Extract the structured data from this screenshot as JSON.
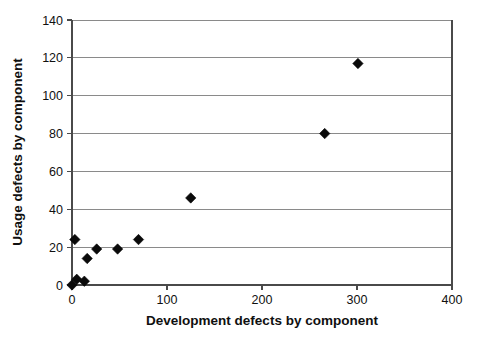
{
  "chart_data": {
    "type": "scatter",
    "title": "",
    "xlabel": "Development defects by component",
    "ylabel": "Usage defects by component",
    "xlim": [
      0,
      400
    ],
    "ylim": [
      0,
      140
    ],
    "xticks": [
      0,
      100,
      200,
      300,
      400
    ],
    "yticks": [
      0,
      20,
      40,
      60,
      80,
      100,
      120,
      140
    ],
    "xtick_labels": [
      "0",
      "100",
      "200",
      "300",
      "400"
    ],
    "ytick_labels": [
      "0",
      "20",
      "40",
      "60",
      "80",
      "100",
      "120",
      "140"
    ],
    "grid": "horizontal",
    "legend": null,
    "marker": "diamond",
    "marker_color": "#0a0a0a",
    "series": [
      {
        "name": "components",
        "points": [
          {
            "x": 0,
            "y": 0
          },
          {
            "x": 3,
            "y": 24
          },
          {
            "x": 5,
            "y": 3
          },
          {
            "x": 13,
            "y": 2
          },
          {
            "x": 16,
            "y": 14
          },
          {
            "x": 26,
            "y": 19
          },
          {
            "x": 48,
            "y": 19
          },
          {
            "x": 70,
            "y": 24
          },
          {
            "x": 125,
            "y": 46
          },
          {
            "x": 266,
            "y": 80
          },
          {
            "x": 301,
            "y": 117
          }
        ]
      }
    ]
  },
  "figure": {
    "background_color": "#ffffff",
    "grid_color": "#8a8a8a",
    "axis_color": "#4a4a4a"
  }
}
